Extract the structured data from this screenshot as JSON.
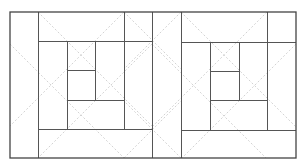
{
  "diagram": {
    "title": "",
    "colors": {
      "background": "#ffffff",
      "solid_line": "#555555",
      "outer_border": "#444444",
      "dashed_line": "#c8c8c8"
    },
    "outer": {
      "x": 10,
      "y": 12,
      "w": 286,
      "h": 146
    },
    "solid_lines": [
      {
        "id": "left-strip",
        "x1": 38,
        "y1": 12,
        "x2": 38,
        "y2": 158
      },
      {
        "id": "left-top-band",
        "x1": 38,
        "y1": 41,
        "x2": 152,
        "y2": 41
      },
      {
        "id": "left-right-band",
        "x1": 124,
        "y1": 12,
        "x2": 124,
        "y2": 129
      },
      {
        "id": "left-bottom-band",
        "x1": 38,
        "y1": 129,
        "x2": 152,
        "y2": 129
      },
      {
        "id": "center-divider",
        "x1": 152,
        "y1": 12,
        "x2": 152,
        "y2": 158
      },
      {
        "id": "left-inner-v1",
        "x1": 67,
        "y1": 41,
        "x2": 67,
        "y2": 129
      },
      {
        "id": "left-inner-h1",
        "x1": 67,
        "y1": 70,
        "x2": 95,
        "y2": 70
      },
      {
        "id": "left-inner-v2",
        "x1": 95,
        "y1": 41,
        "x2": 95,
        "y2": 100
      },
      {
        "id": "left-inner-h2",
        "x1": 67,
        "y1": 100,
        "x2": 124,
        "y2": 100
      },
      {
        "id": "right-strip",
        "x1": 181,
        "y1": 12,
        "x2": 181,
        "y2": 158
      },
      {
        "id": "right-top-band",
        "x1": 181,
        "y1": 42,
        "x2": 296,
        "y2": 42
      },
      {
        "id": "right-right-band",
        "x1": 267,
        "y1": 12,
        "x2": 267,
        "y2": 130
      },
      {
        "id": "right-bottom-band",
        "x1": 181,
        "y1": 130,
        "x2": 296,
        "y2": 130
      },
      {
        "id": "right-inner-v1",
        "x1": 210,
        "y1": 42,
        "x2": 210,
        "y2": 130
      },
      {
        "id": "right-inner-h1",
        "x1": 210,
        "y1": 71,
        "x2": 239,
        "y2": 71
      },
      {
        "id": "right-inner-v2",
        "x1": 239,
        "y1": 42,
        "x2": 239,
        "y2": 100
      },
      {
        "id": "right-inner-h2",
        "x1": 210,
        "y1": 100,
        "x2": 267,
        "y2": 100
      }
    ],
    "dashed_lines": [
      {
        "x1": 38,
        "y1": 12,
        "x2": 152,
        "y2": 126
      },
      {
        "x1": 124,
        "y1": 12,
        "x2": 10,
        "y2": 126
      },
      {
        "x1": 10,
        "y1": 44,
        "x2": 124,
        "y2": 158
      },
      {
        "x1": 152,
        "y1": 44,
        "x2": 38,
        "y2": 158
      },
      {
        "x1": 10,
        "y1": 12,
        "x2": 10,
        "y2": 12
      },
      {
        "x1": 124,
        "y1": 12,
        "x2": 181,
        "y2": 69
      },
      {
        "x1": 181,
        "y1": 12,
        "x2": 124,
        "y2": 69
      },
      {
        "x1": 181,
        "y1": 12,
        "x2": 296,
        "y2": 127
      },
      {
        "x1": 267,
        "y1": 12,
        "x2": 152,
        "y2": 127
      },
      {
        "x1": 152,
        "y1": 44,
        "x2": 266,
        "y2": 158
      },
      {
        "x1": 296,
        "y1": 44,
        "x2": 182,
        "y2": 158
      },
      {
        "x1": 124,
        "y1": 158,
        "x2": 181,
        "y2": 101
      },
      {
        "x1": 181,
        "y1": 158,
        "x2": 124,
        "y2": 101
      }
    ]
  }
}
